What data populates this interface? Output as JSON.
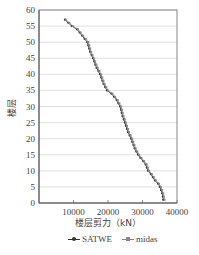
{
  "chart_data": {
    "type": "line",
    "title": "",
    "xlabel": "楼层剪力（kN）",
    "ylabel": "楼层",
    "xlim": [
      0,
      40000
    ],
    "ylim": [
      0,
      60
    ],
    "xticks": [
      "10000",
      "20000",
      "30000",
      "40000"
    ],
    "yticks": [
      "0",
      "5",
      "10",
      "15",
      "20",
      "25",
      "30",
      "35",
      "40",
      "45",
      "50",
      "55",
      "60"
    ],
    "grid": "horizontal",
    "legend_position": "bottom",
    "series": [
      {
        "name": "SATWE",
        "color": "#333333",
        "x": [
          36000,
          35900,
          35700,
          35400,
          35000,
          34500,
          33600,
          33000,
          32400,
          31600,
          30900,
          30200,
          29400,
          28700,
          27700,
          26700,
          25800,
          24900,
          24200,
          23500,
          22500,
          21000,
          19700,
          18700,
          17700,
          16700,
          15650,
          14800,
          14000,
          12500,
          11000,
          9500,
          7500
        ],
        "y": [
          1,
          2,
          3,
          4,
          5,
          6,
          7,
          8,
          9,
          10,
          12,
          13,
          14,
          15,
          17,
          20,
          22,
          25,
          27,
          30,
          32,
          34,
          35,
          37,
          40,
          42,
          45,
          47,
          50,
          52,
          54,
          55,
          57
        ]
      },
      {
        "name": "midas",
        "color": "#888888",
        "x": [
          36400,
          36200,
          36000,
          35700,
          35300,
          34800,
          33900,
          33300,
          32700,
          31900,
          31200,
          30500,
          29700,
          29000,
          28000,
          27000,
          26100,
          25200,
          24500,
          23800,
          22800,
          21300,
          20000,
          19000,
          18000,
          17000,
          15900,
          15100,
          14300,
          12800,
          11300,
          9800,
          7800
        ],
        "y": [
          1,
          2,
          3,
          4,
          5,
          6,
          7,
          8,
          9,
          10,
          12,
          13,
          14,
          15,
          17,
          20,
          22,
          25,
          27,
          30,
          32,
          34,
          35,
          37,
          40,
          42,
          45,
          47,
          50,
          52,
          54,
          55,
          57
        ]
      }
    ]
  },
  "legend": {
    "items": [
      {
        "label": "SATWE"
      },
      {
        "label": "midas"
      }
    ]
  }
}
